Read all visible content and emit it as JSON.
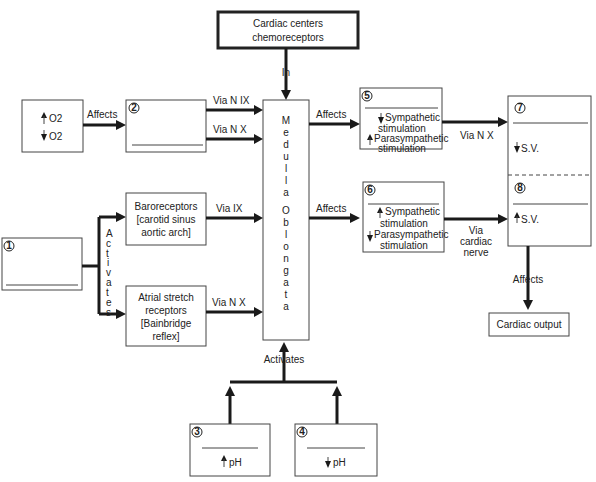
{
  "title_box": {
    "line1": "Cardiac centers",
    "line2": "chemoreceptors"
  },
  "medulla": {
    "letters": [
      "M",
      "e",
      "d",
      "u",
      "l",
      "l",
      "a",
      "",
      "O",
      "b",
      "l",
      "o",
      "n",
      "g",
      "a",
      "t",
      "a"
    ],
    "label": "Medulla Oblongata"
  },
  "o2_box": {
    "up": "O2",
    "down": "O2"
  },
  "box2": {
    "number": "2"
  },
  "box1": {
    "number": "1"
  },
  "box3": {
    "number": "3",
    "text": "pH",
    "direction": "up"
  },
  "box4": {
    "number": "4",
    "text": "pH",
    "direction": "down"
  },
  "baro": {
    "line1": "Baroreceptors",
    "line2": "[carotid sinus",
    "line3": "aortic arch]"
  },
  "atrial": {
    "line1": "Atrial stretch",
    "line2": "receptors",
    "line3": "[Bainbridge",
    "line4": "reflex]"
  },
  "box5": {
    "number": "5",
    "l1": "Sympathetic",
    "l2": "stimulation",
    "l3": "Parasympathetic",
    "l4": "stimulation"
  },
  "box6": {
    "number": "6",
    "l1": "Sympathetic",
    "l2": "stimulation",
    "l3": "Parasympathetic",
    "l4": "stimulation"
  },
  "box7": {
    "number": "7",
    "text": "S.V."
  },
  "box8": {
    "number": "8",
    "text": "S.V."
  },
  "cardiac_output": "Cardiac output",
  "labels": {
    "in": "In",
    "affects1": "Affects",
    "via_n_ix": "Via N IX",
    "via_n_x": "Via N X",
    "via_ix": "Via  IX",
    "via_n_x2": "Via  N X",
    "affects5": "Affects",
    "affects6": "Affects",
    "via_n_x5": "Via N X",
    "via": "Via",
    "cardiac": "cardiac",
    "nerve": "nerve",
    "affects_out": "Affects",
    "activates_bottom": "Activates",
    "activates_side": [
      "A",
      "c",
      "t",
      "i",
      "v",
      "a",
      "t",
      "e",
      "s"
    ]
  }
}
